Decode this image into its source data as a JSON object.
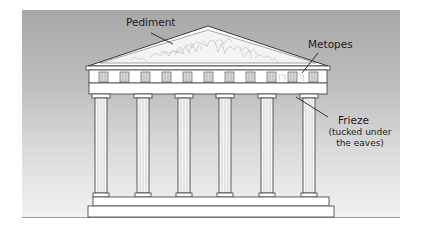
{
  "diagram": {
    "labels": {
      "pediment": "Pediment",
      "metopes": "Metopes",
      "frieze": "Frieze",
      "frieze_note_line1": "(tucked under",
      "frieze_note_line2": "the eaves)"
    },
    "column_count": 6,
    "colors": {
      "background_top": "#a8a8a8",
      "background_bottom": "#f2f2f2",
      "stone": "#ffffff",
      "outline": "#3a3a3a",
      "triglyph": "#d8d8d8"
    }
  }
}
